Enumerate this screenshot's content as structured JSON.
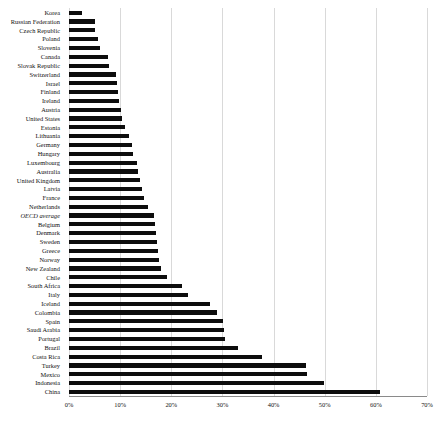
{
  "chart_data": {
    "type": "bar",
    "orientation": "horizontal",
    "title": "",
    "xlabel": "",
    "ylabel": "",
    "xlim": [
      0,
      70
    ],
    "xunit": "%",
    "xticks": [
      "0%",
      "10%",
      "20%",
      "30%",
      "40%",
      "50%",
      "60%",
      "70%"
    ],
    "xtick_values": [
      0,
      10,
      20,
      30,
      40,
      50,
      60,
      70
    ],
    "grid": true,
    "grid_axis": "x",
    "legend": "none",
    "bar_color": "#0d0d0d",
    "categories": [
      "Korea",
      "Russian Federation",
      "Czech Republic",
      "Poland",
      "Slovenia",
      "Canada",
      "Slovak Republic",
      "Switzerland",
      "Israel",
      "Finland",
      "Ireland",
      "Austria",
      "United States",
      "Estonia",
      "Lithuania",
      "Germany",
      "Hungary",
      "Luxembourg",
      "Australia",
      "United Kingdom",
      "Latvia",
      "France",
      "Netherlands",
      "OECD average",
      "Belgium",
      "Denmark",
      "Sweden",
      "Greece",
      "Norway",
      "New Zealand",
      "Chile",
      "South Africa",
      "Italy",
      "Iceland",
      "Colombia",
      "Spain",
      "Saudi Arabia",
      "Portugal",
      "Brazil",
      "Costa Rica",
      "Turkey",
      "Mexico",
      "Indonesia",
      "China"
    ],
    "values": [
      2.5,
      5.1,
      5.1,
      5.6,
      6.1,
      7.6,
      7.8,
      9.2,
      9.4,
      9.6,
      9.8,
      10.2,
      10.4,
      11.0,
      11.8,
      12.4,
      12.6,
      13.2,
      13.4,
      13.8,
      14.2,
      14.6,
      15.4,
      16.6,
      16.8,
      17.0,
      17.2,
      17.4,
      17.6,
      18.0,
      19.2,
      22.0,
      23.2,
      27.6,
      29.0,
      30.2,
      30.4,
      30.6,
      33.0,
      37.8,
      46.4,
      46.6,
      49.8,
      60.8
    ],
    "italic_categories": [
      "OECD average"
    ]
  }
}
